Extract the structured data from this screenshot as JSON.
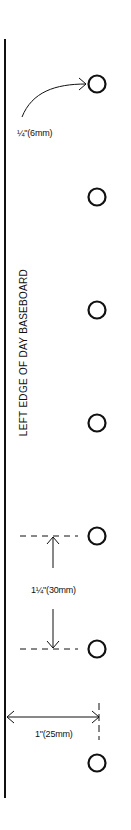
{
  "diagram": {
    "edge_label": "LEFT EDGE OF DAY BASEBOARD",
    "hole_size_label": "¼\"(6mm)",
    "hole_spacing_label": "1¼\"(30mm)",
    "edge_offset_label": "1\"(25mm)",
    "hole_count": 7,
    "colors": {
      "ink": "#111111",
      "background": "#ffffff"
    }
  }
}
